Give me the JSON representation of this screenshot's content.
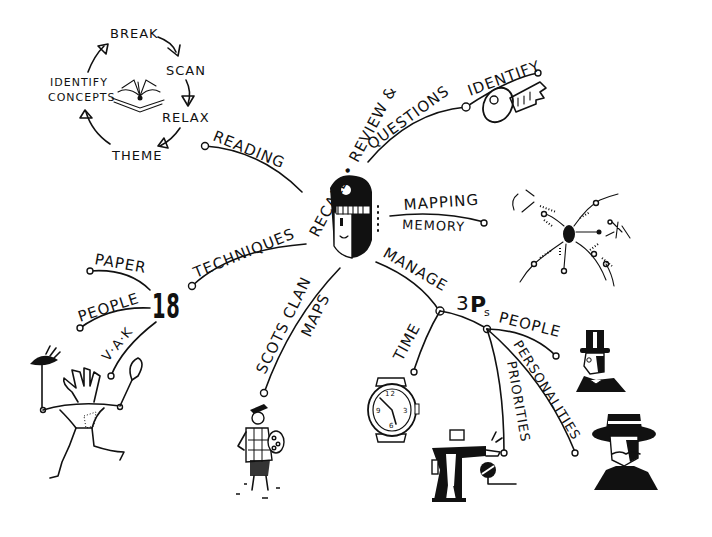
{
  "diagram": {
    "type": "mind-map",
    "center": {
      "label": "RECALL • REVIEW &",
      "icon": "half-shaded-face-icon"
    },
    "reading_cycle": {
      "steps": [
        "BREAK",
        "SCAN",
        "RELAX",
        "THEME",
        "IDENTIFY CONCEPTS"
      ],
      "step_labels": {
        "break": "BREAK",
        "scan": "SCAN",
        "relax": "RELAX",
        "theme": "THEME",
        "identify_line1": "IDENTIFY",
        "identify_line2": "CONCEPTS"
      },
      "icon": "open-book-icon"
    },
    "branches": {
      "reading": "READING",
      "questions": "QUESTIONS",
      "identify": "IDENTIFY",
      "mapping": "MAPPING",
      "memory": "MEMORY",
      "techniques": "TECHNIQUES",
      "eighteen": "18",
      "paper": "PAPER",
      "people_left": "PEOPLE",
      "vak": "V·A·K",
      "scots_clan": "SCOTS CLAN",
      "maps": "MAPS",
      "manage": "MANAGE",
      "three": "3",
      "ps": "P",
      "ps_sub": "s",
      "time": "TIME",
      "priorities": "PRIORITIES",
      "personalities": "PERSONALITIES",
      "people_right": "PEOPLE"
    },
    "illustrations": [
      "key-icon",
      "mini-mind-map-icon",
      "vak-figure-icon",
      "highlander-icon",
      "wristwatch-icon",
      "pointing-man-icon",
      "top-hat-gentleman-icon",
      "wide-hat-gentleman-icon"
    ],
    "colors": {
      "ink": "#111111",
      "background": "#ffffff"
    }
  }
}
